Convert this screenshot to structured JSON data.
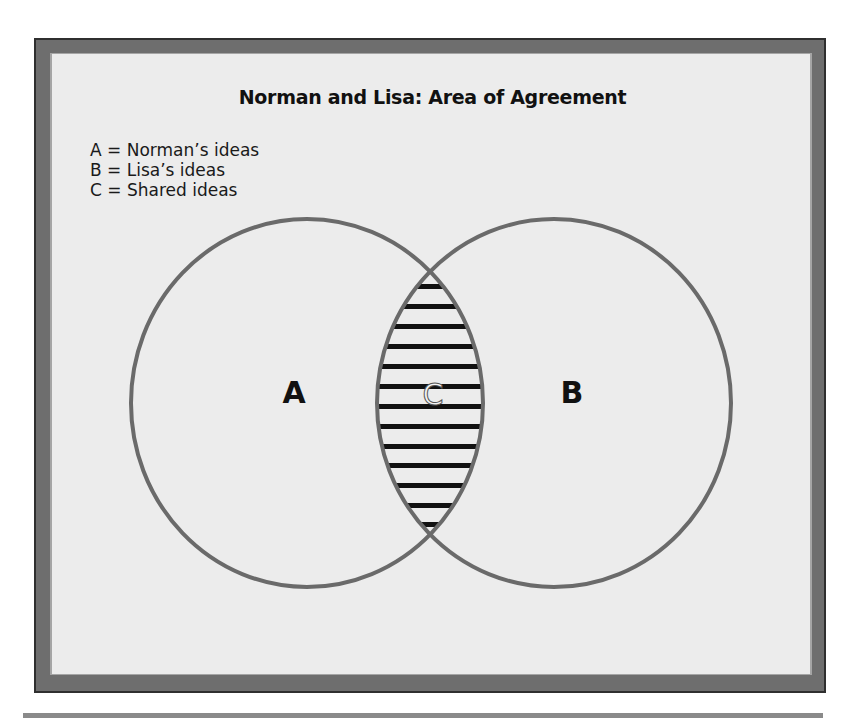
{
  "figure": {
    "title": "Norman and Lisa: Area of Agreement",
    "legend": [
      {
        "key": "A",
        "text": "A = Norman’s ideas"
      },
      {
        "key": "B",
        "text": "B = Lisa’s ideas"
      },
      {
        "key": "C",
        "text": "C = Shared ideas"
      }
    ],
    "labels": {
      "left_circle": "A",
      "right_circle": "B",
      "intersection": "C"
    },
    "colors": {
      "frame": "#6e6e6e",
      "panel": "#ececec",
      "circle_stroke": "#6a6a6a",
      "stripe": "#111111",
      "rule": "#8a8a8a"
    }
  }
}
